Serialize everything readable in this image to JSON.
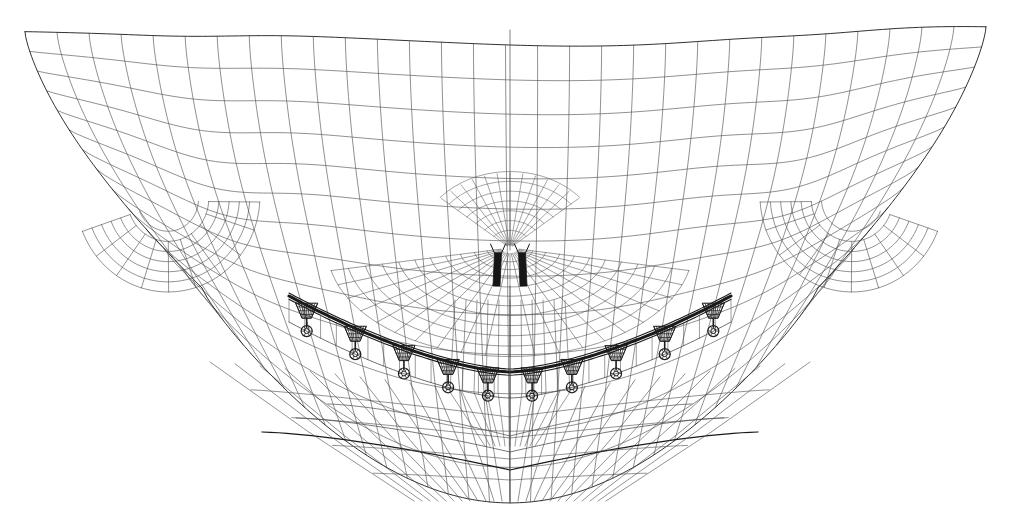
{
  "figure": {
    "type": "fem-wireframe-mesh",
    "view": "frontal-anterior",
    "background_color": "#ffffff",
    "line_color": "#4a4a4a",
    "heavy_line_color": "#1a1a1a",
    "canvas": {
      "width": 1010,
      "height": 529
    },
    "symmetry": {
      "axis": "vertical",
      "x": 510
    }
  },
  "mesh": {
    "name": "alveolar-bone-block",
    "bounds": {
      "left": 25,
      "right": 986,
      "top": 28,
      "bottom": 503
    },
    "top_edge": {
      "left_x": 25,
      "left_y": 30,
      "shoulder_y": 36,
      "center_x": 510,
      "center_y": 44,
      "right_x": 986,
      "right_y": 30
    },
    "bottom_apex": {
      "x": 510,
      "y": 503
    },
    "u_radius_x": 300,
    "u_radius_y": 215,
    "rings": 13,
    "radials": 30,
    "line_width": 0.65
  },
  "arch": {
    "name": "dental-arch-curve",
    "center_x": 510,
    "apex_y": 372,
    "end_x_left": 289,
    "end_y_left": 296,
    "half_width": 221,
    "depth": 76,
    "wire_thickness": 3.0,
    "wire_color": "#2a2a2a",
    "inner_offset": 26
  },
  "brackets": {
    "name": "orthodontic-brackets",
    "count_per_side": 5,
    "count_total": 10,
    "positions_t": [
      0.08,
      0.3,
      0.52,
      0.72,
      0.9
    ],
    "base_half_width": 11,
    "base_height": 13,
    "ring_radius": 5.5,
    "stem_length": 9,
    "color": "#1c1c1c"
  },
  "incisors": {
    "name": "central-incisor-pair",
    "left_x": 498,
    "right_x": 522,
    "top_y": 253,
    "bottom_y": 286,
    "width": 7,
    "color": "#161616"
  },
  "fan": {
    "name": "central-radial-refinement",
    "origin_x": 510,
    "origin_y": 248,
    "spread_deg": 78,
    "rays": 21,
    "arcs": 11,
    "max_radius": 118
  },
  "molar_zones": {
    "name": "posterior-refinement-zones",
    "left": {
      "cx": 168,
      "cy": 196,
      "rx": 92,
      "ry": 120
    },
    "right": {
      "cx": 852,
      "cy": 196,
      "rx": 92,
      "ry": 120
    }
  },
  "legend": {
    "visible": false,
    "items": []
  },
  "annotations": {
    "visible": false,
    "items": []
  }
}
